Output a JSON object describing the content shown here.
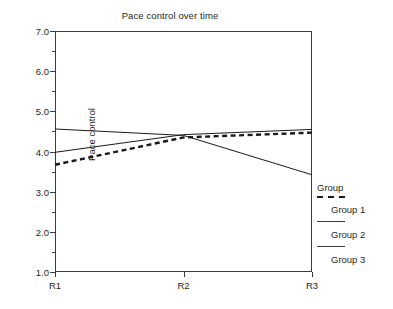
{
  "chart_data": {
    "type": "line",
    "title": "Pace control over time",
    "xlabel": "",
    "ylabel": "Pace control",
    "categories": [
      "R1",
      "R2",
      "R3"
    ],
    "ylim": [
      1.0,
      7.0
    ],
    "ytick_labels": [
      "1.0",
      "2.0",
      "3.0",
      "4.0",
      "5.0",
      "6.0",
      "7.0"
    ],
    "ytick_values": [
      1.0,
      2.0,
      3.0,
      4.0,
      5.0,
      6.0,
      7.0
    ],
    "yminor_values": [
      1.5,
      2.5,
      3.5,
      4.5,
      5.5,
      6.5
    ],
    "grid": false,
    "legend_position": "right",
    "legend_title": "Group",
    "series": [
      {
        "name": "Group 1",
        "style": "dashed",
        "values": [
          3.67,
          4.35,
          4.47
        ]
      },
      {
        "name": "Group 2",
        "style": "solid",
        "values": [
          3.98,
          4.42,
          4.55
        ]
      },
      {
        "name": "Group 3",
        "style": "solid",
        "values": [
          4.56,
          4.4,
          3.42
        ]
      }
    ]
  },
  "legend": {
    "title": "Group",
    "entries": [
      {
        "label": "Group 1",
        "style": "dashed"
      },
      {
        "label": "Group 2",
        "style": "solid"
      },
      {
        "label": "Group 3",
        "style": "solid"
      }
    ]
  },
  "colors": {
    "line": "#1a1a1a",
    "axis": "#3c3c3c",
    "text": "#1f1f1f",
    "background": "#ffffff"
  }
}
